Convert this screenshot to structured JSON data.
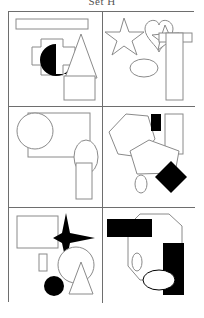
{
  "caption": {
    "text": "Set H"
  },
  "figure": {
    "title": "Set H",
    "layout": "2 columns x 3 rows grid of shape panels",
    "border_color": "#6e6e6e",
    "outline_color": "#8a8a8a",
    "fill_black": "#000000",
    "fill_white": "#ffffff",
    "background": "#ffffff",
    "panel_count": 6
  },
  "panels": [
    {
      "id": "panel-1",
      "position": "top-left",
      "label": "Panel 1",
      "shapes": [
        {
          "name": "thin-rectangle",
          "kind": "rectangle",
          "fill": "white",
          "outline": true
        },
        {
          "name": "cross-shape",
          "kind": "cross",
          "fill": "white",
          "outline": true
        },
        {
          "name": "pacman-circle",
          "kind": "pacman",
          "fill": "black",
          "outline": false
        },
        {
          "name": "triangle",
          "kind": "triangle",
          "fill": "white",
          "outline": true
        },
        {
          "name": "rectangle",
          "kind": "rectangle",
          "fill": "white",
          "outline": true
        }
      ]
    },
    {
      "id": "panel-2",
      "position": "top-right",
      "label": "Panel 2",
      "shapes": [
        {
          "name": "large-star",
          "kind": "star",
          "fill": "white",
          "outline": true
        },
        {
          "name": "heart",
          "kind": "heart",
          "fill": "white",
          "outline": true
        },
        {
          "name": "small-star",
          "kind": "star",
          "fill": "white",
          "outline": true
        },
        {
          "name": "ellipse",
          "kind": "ellipse",
          "fill": "white",
          "outline": true
        },
        {
          "name": "tall-rectangle",
          "kind": "rectangle",
          "fill": "white",
          "outline": true
        },
        {
          "name": "horizontal-bar",
          "kind": "rectangle",
          "fill": "white",
          "outline": true
        }
      ]
    },
    {
      "id": "panel-3",
      "position": "middle-left",
      "label": "Panel 3",
      "shapes": [
        {
          "name": "circle",
          "kind": "circle",
          "fill": "white",
          "outline": true
        },
        {
          "name": "large-rectangle",
          "kind": "rectangle",
          "fill": "white",
          "outline": true
        },
        {
          "name": "ellipse",
          "kind": "ellipse",
          "fill": "white",
          "outline": true
        },
        {
          "name": "vertical-rectangle",
          "kind": "rectangle",
          "fill": "white",
          "outline": true
        }
      ]
    },
    {
      "id": "panel-4",
      "position": "middle-right",
      "label": "Panel 4",
      "shapes": [
        {
          "name": "hexagon",
          "kind": "hexagon",
          "fill": "white",
          "outline": true
        },
        {
          "name": "pentagon",
          "kind": "pentagon",
          "fill": "white",
          "outline": true
        },
        {
          "name": "small-black-rectangle",
          "kind": "rectangle",
          "fill": "black",
          "outline": false
        },
        {
          "name": "tall-rectangle",
          "kind": "rectangle",
          "fill": "white",
          "outline": true
        },
        {
          "name": "black-diamond",
          "kind": "diamond",
          "fill": "black",
          "outline": false
        },
        {
          "name": "small-ellipse",
          "kind": "ellipse",
          "fill": "white",
          "outline": true
        }
      ]
    },
    {
      "id": "panel-5",
      "position": "bottom-left",
      "label": "Panel 5",
      "shapes": [
        {
          "name": "rectangle",
          "kind": "rectangle",
          "fill": "white",
          "outline": true
        },
        {
          "name": "black-four-point-star",
          "kind": "star4",
          "fill": "black",
          "outline": false
        },
        {
          "name": "small-rectangle",
          "kind": "rectangle",
          "fill": "white",
          "outline": true
        },
        {
          "name": "circle",
          "kind": "circle",
          "fill": "white",
          "outline": true
        },
        {
          "name": "black-circle",
          "kind": "circle",
          "fill": "black",
          "outline": false
        },
        {
          "name": "triangle",
          "kind": "triangle",
          "fill": "white",
          "outline": true
        }
      ]
    },
    {
      "id": "panel-6",
      "position": "bottom-right",
      "label": "Panel 6",
      "shapes": [
        {
          "name": "black-horizontal-rectangle",
          "kind": "rectangle",
          "fill": "black",
          "outline": false
        },
        {
          "name": "octagon",
          "kind": "octagon",
          "fill": "white",
          "outline": true
        },
        {
          "name": "black-vertical-rectangle",
          "kind": "rectangle",
          "fill": "black",
          "outline": false
        },
        {
          "name": "white-ellipse",
          "kind": "ellipse",
          "fill": "white",
          "outline": true
        },
        {
          "name": "small-ellipse",
          "kind": "ellipse",
          "fill": "white",
          "outline": true
        }
      ]
    }
  ]
}
